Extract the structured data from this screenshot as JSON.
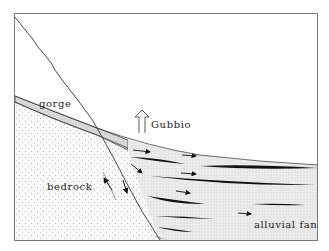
{
  "diagram": {
    "type": "geological cross-section",
    "labels": {
      "gorge": "gorge",
      "town": "Gubbio",
      "bedrock": "bedrock",
      "fan": "alluvial fan"
    },
    "colors": {
      "line": "#333333",
      "frame": "#777777",
      "bedrock_fill": "#f4f4f4",
      "fan_fill": "#e8e8e8",
      "gorge_fill": "#dcdcdc",
      "lens": "#111111"
    }
  }
}
